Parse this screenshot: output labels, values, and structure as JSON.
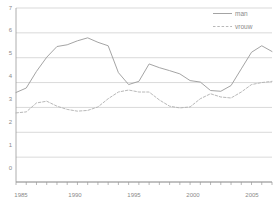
{
  "chart_data": {
    "type": "line",
    "title": "",
    "subtitle": "",
    "xlabel": "",
    "ylabel": "",
    "xlim": [
      1985,
      2006
    ],
    "ylim": [
      0,
      7
    ],
    "yticks": [
      0,
      1,
      2,
      3,
      4,
      5,
      6,
      7
    ],
    "ytick_labels": [
      "0",
      "1",
      "2",
      "3",
      "4",
      "5",
      "6",
      "7"
    ],
    "xticks": [
      1985,
      1990,
      1995,
      2000,
      2005
    ],
    "xtick_labels": [
      "1985",
      "1990",
      "1995",
      "2000",
      "2005"
    ],
    "grid": true,
    "grid_axis": "y",
    "legend_position": "top-right",
    "x": [
      1985,
      1986,
      1987,
      1988,
      1989,
      1990,
      1991,
      1992,
      1993,
      1994,
      1995,
      1996,
      1997,
      1998,
      1999,
      2000,
      2001,
      2002,
      2003,
      2004,
      2005,
      2006
    ],
    "series": [
      {
        "name": "man",
        "style": "solid",
        "color": "#9a9a9a",
        "values": [
          3.6,
          3.78,
          4.45,
          5.02,
          5.45,
          5.52,
          5.68,
          5.8,
          5.62,
          5.48,
          4.4,
          3.92,
          4.05,
          4.75,
          4.6,
          4.48,
          4.35,
          4.08,
          4.02,
          3.68,
          3.65,
          3.88
        ]
      },
      {
        "name": "vrouw",
        "style": "dashed",
        "color": "#b0b0b0",
        "values": [
          2.78,
          2.82,
          3.18,
          3.25,
          3.05,
          2.92,
          2.85,
          2.88,
          3.02,
          3.35,
          3.62,
          3.7,
          3.62,
          3.62,
          3.3,
          3.05,
          2.98,
          3.02,
          3.35,
          3.55,
          3.42,
          3.38
        ]
      }
    ],
    "series_tail": {
      "note": "continuation of both series to right edge",
      "x": [
        2006,
        2007,
        2008,
        2009,
        2010
      ],
      "man": [
        3.88,
        4.55,
        5.22,
        5.48,
        5.25
      ],
      "vrouw": [
        3.38,
        3.62,
        3.92,
        4.0,
        4.05
      ]
    }
  },
  "legend": {
    "items": [
      {
        "label": "man",
        "style": "solid"
      },
      {
        "label": "vrouw",
        "style": "dashed"
      }
    ]
  },
  "axes": {
    "y_tick_labels": [
      "7",
      "6",
      "5",
      "4",
      "3",
      "2",
      "1",
      "0"
    ],
    "x_tick_labels": [
      "1985",
      "1990",
      "1995",
      "2000",
      "2005"
    ]
  },
  "colors": {
    "man_line": "#9a9a9a",
    "vrouw_line": "#b0b0b0",
    "grid": "#c9c9c9",
    "axis": "#9a9a9a",
    "text": "#8a8a8a",
    "background": "#ffffff"
  }
}
